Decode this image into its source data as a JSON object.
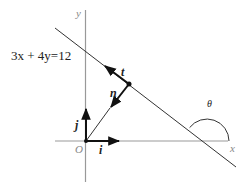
{
  "diagram": {
    "equation": "3x + 4y=12",
    "axes": {
      "x_label": "x",
      "y_label": "y",
      "origin_label": "O"
    },
    "vectors": {
      "i_label": "i",
      "j_label": "j",
      "t_label": "t",
      "n_label": "n"
    },
    "angle_label": "θ",
    "colors": {
      "axis": "#999999",
      "line": "#333333",
      "vector": "#111111",
      "background": "#ffffff"
    }
  }
}
